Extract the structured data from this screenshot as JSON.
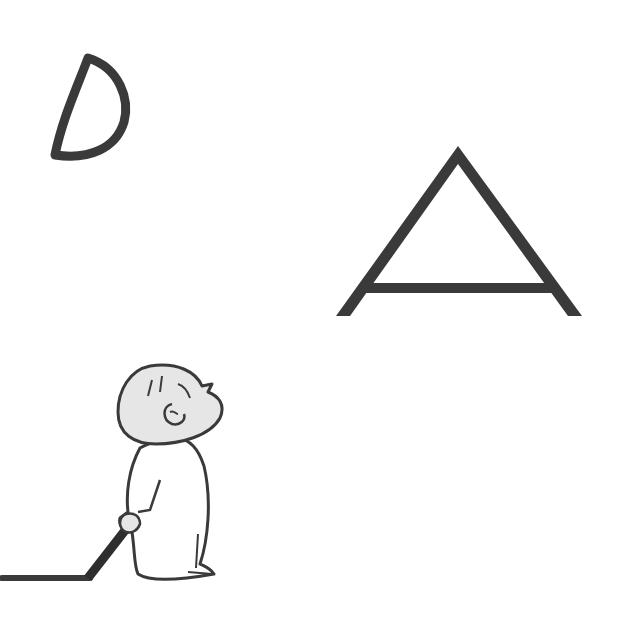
{
  "scene": {
    "description": "Line illustration: a child holding a crayon looking up at a drawn crescent moon and a triangle",
    "background_color": "#ffffff",
    "ink_color": "#3a3a3a",
    "skin_fill": "#e6e6e6",
    "elements": [
      {
        "name": "crescent-moon",
        "shape": "D-shaped crescent outline"
      },
      {
        "name": "triangle",
        "shape": "A-shaped triangle with extended crossbar"
      },
      {
        "name": "child-figure",
        "shape": "bald child in pajamas looking up"
      },
      {
        "name": "crayon",
        "shape": "dark crayon held in hand"
      },
      {
        "name": "crayon-line",
        "shape": "drawn line along ground"
      }
    ]
  }
}
